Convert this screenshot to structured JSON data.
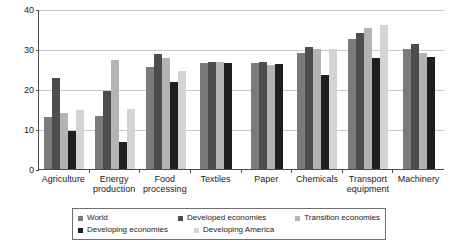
{
  "chart_data": {
    "type": "bar",
    "title": "",
    "subtitle": "",
    "xlabel": "",
    "ylabel": "",
    "ylim": [
      0,
      40
    ],
    "yticks": [
      0,
      10,
      20,
      30,
      40
    ],
    "grid": true,
    "legend_position": "bottom",
    "categories": [
      "Agriculture",
      "Energy\nproduction",
      "Food\nprocessing",
      "Textiles",
      "Paper",
      "Chemicals",
      "Transport\nequipment",
      "Machinery"
    ],
    "series": [
      {
        "name": "World",
        "color": "#7a7a7a",
        "values": [
          13.0,
          13.2,
          25.5,
          26.5,
          26.5,
          29.0,
          32.5,
          30.0
        ]
      },
      {
        "name": "Developed economies",
        "color": "#4d4d4d",
        "values": [
          22.8,
          19.6,
          28.8,
          26.8,
          26.8,
          30.5,
          34.0,
          31.2
        ]
      },
      {
        "name": "Transition economies",
        "color": "#b3b3b3",
        "values": [
          14.0,
          27.2,
          27.8,
          26.8,
          26.0,
          30.0,
          35.3,
          29.0
        ]
      },
      {
        "name": "Developing economies",
        "color": "#1f1f1f",
        "values": [
          9.5,
          6.7,
          21.8,
          26.5,
          26.2,
          23.4,
          27.8,
          28.0
        ]
      },
      {
        "name": "Developing America",
        "color": "#d4d4d4",
        "values": [
          14.8,
          14.9,
          24.6,
          null,
          null,
          30.0,
          36.0,
          null
        ]
      }
    ]
  },
  "legend": {
    "items": [
      {
        "label": "World",
        "color": "#7a7a7a"
      },
      {
        "label": "Developed economies",
        "color": "#4d4d4d"
      },
      {
        "label": "Transition economies",
        "color": "#b3b3b3"
      },
      {
        "label": "Developing economies",
        "color": "#1f1f1f"
      },
      {
        "label": "Developing America",
        "color": "#d4d4d4"
      }
    ]
  }
}
